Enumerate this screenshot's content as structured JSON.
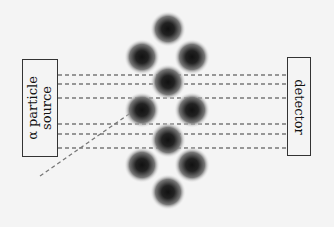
{
  "diagram": {
    "type": "rutherford-scattering-schematic",
    "source": {
      "label_line1": "α particle",
      "label_line2": "source"
    },
    "detector": {
      "label": "detector"
    },
    "nuclei": [
      {
        "cx": 168,
        "cy": 29
      },
      {
        "cx": 142,
        "cy": 57
      },
      {
        "cx": 192,
        "cy": 57
      },
      {
        "cx": 168,
        "cy": 82
      },
      {
        "cx": 142,
        "cy": 110
      },
      {
        "cx": 192,
        "cy": 110
      },
      {
        "cx": 168,
        "cy": 140
      },
      {
        "cx": 142,
        "cy": 165
      },
      {
        "cx": 192,
        "cy": 165
      },
      {
        "cx": 168,
        "cy": 192
      }
    ],
    "straight_paths_y": [
      75,
      84,
      98,
      124,
      134,
      148
    ],
    "deflected_path": {
      "x1": 40,
      "y1": 176,
      "x2": 132,
      "y2": 112
    },
    "colors": {
      "line": "#777777",
      "box": "#333333",
      "nucleus": "#1a1a1a",
      "background": "#f4f4f4"
    }
  }
}
